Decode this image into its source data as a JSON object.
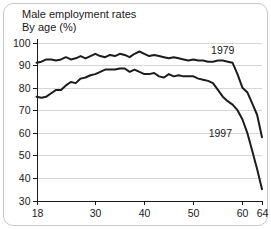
{
  "figure": {
    "title_line_1": "Male employment rates",
    "title_line_2": "By age (%)"
  },
  "chart_data": {
    "type": "line",
    "title": "Male employment rates By age (%)",
    "xlabel": "",
    "ylabel": "",
    "xlim": [
      18,
      64
    ],
    "ylim": [
      30,
      100
    ],
    "grid": true,
    "legend_position": "inline-annotation",
    "xticks": [
      18,
      30,
      40,
      50,
      60,
      64
    ],
    "xtick_labels": [
      "18",
      "30",
      "40",
      "50",
      "60",
      "64"
    ],
    "yticks": [
      30,
      40,
      50,
      60,
      70,
      80,
      90,
      100
    ],
    "ytick_labels": [
      "30",
      "40",
      "50",
      "60",
      "70",
      "80",
      "90",
      "100"
    ],
    "x": [
      18,
      19,
      20,
      21,
      22,
      23,
      24,
      25,
      26,
      27,
      28,
      29,
      30,
      31,
      32,
      33,
      34,
      35,
      36,
      37,
      38,
      39,
      40,
      41,
      42,
      43,
      44,
      45,
      46,
      47,
      48,
      49,
      50,
      51,
      52,
      53,
      54,
      55,
      56,
      57,
      58,
      59,
      60,
      61,
      62,
      63,
      64
    ],
    "series": [
      {
        "name": "1979",
        "label": "1979",
        "label_x": 56,
        "label_y": 95,
        "values": [
          91,
          91.5,
          92.5,
          92.5,
          92,
          92.5,
          93.5,
          92.5,
          93,
          94,
          93,
          94,
          95,
          94,
          93.5,
          94.5,
          94,
          95,
          94.5,
          93.5,
          95,
          96,
          95,
          94,
          94.5,
          94,
          93.5,
          93,
          93.5,
          93,
          92.5,
          92,
          92.5,
          92,
          92,
          91.5,
          91.5,
          92,
          92,
          91.5,
          91,
          86,
          80,
          78,
          73,
          68,
          58
        ]
      },
      {
        "name": "1997",
        "label": "1997",
        "label_x": 55.5,
        "label_y": 58,
        "values": [
          76,
          75.5,
          76,
          77.5,
          79,
          79,
          81,
          82.5,
          82,
          84,
          84.5,
          85.5,
          86,
          87,
          88,
          88,
          88,
          88.5,
          88.5,
          87,
          88,
          87,
          86,
          86,
          86.5,
          85,
          84.5,
          86,
          85,
          85.5,
          85,
          85,
          85,
          84,
          83.5,
          83,
          82,
          79,
          76,
          74,
          72.5,
          70,
          66,
          60,
          52,
          44,
          35
        ]
      }
    ]
  }
}
